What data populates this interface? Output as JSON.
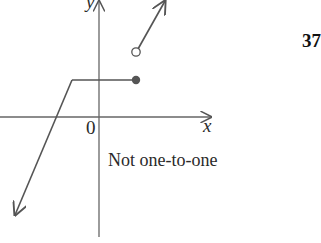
{
  "diagram": {
    "axes": {
      "x_label": "x",
      "y_label": "y",
      "origin_label": "0"
    },
    "caption": "Not one-to-one",
    "problem_number": "37",
    "colors": {
      "stroke": "#555555",
      "text": "#2a2a2a"
    },
    "pieces": [
      {
        "type": "ray",
        "description": "line rising from lower-left arrow to corner point left of y-axis"
      },
      {
        "type": "segment",
        "description": "horizontal segment ending at filled dot",
        "endpoint": "closed"
      },
      {
        "type": "ray",
        "description": "line starting at open circle rising to upper-right arrow",
        "endpoint": "open"
      }
    ]
  }
}
